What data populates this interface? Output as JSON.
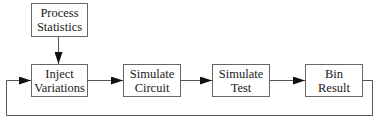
{
  "diagram": {
    "colors": {
      "line": "#555555",
      "box_border": "#666666",
      "arrowhead": "#111111",
      "text": "#1a1a1a",
      "background": "#ffffff"
    },
    "nodes": [
      {
        "id": "process-statistics",
        "lines": [
          "Process",
          "Statistics"
        ]
      },
      {
        "id": "inject-variations",
        "lines": [
          "Inject",
          "Variations"
        ]
      },
      {
        "id": "simulate-circuit",
        "lines": [
          "Simulate",
          "Circuit"
        ]
      },
      {
        "id": "simulate-test",
        "lines": [
          "Simulate",
          "Test"
        ]
      },
      {
        "id": "bin-result",
        "lines": [
          "Bin",
          "Result"
        ]
      }
    ],
    "edges": [
      {
        "from": "process-statistics",
        "to": "inject-variations"
      },
      {
        "from": "inject-variations",
        "to": "simulate-circuit"
      },
      {
        "from": "simulate-circuit",
        "to": "simulate-test"
      },
      {
        "from": "simulate-test",
        "to": "bin-result"
      },
      {
        "from": "bin-result",
        "to": "inject-variations",
        "type": "feedback-loop"
      }
    ]
  }
}
